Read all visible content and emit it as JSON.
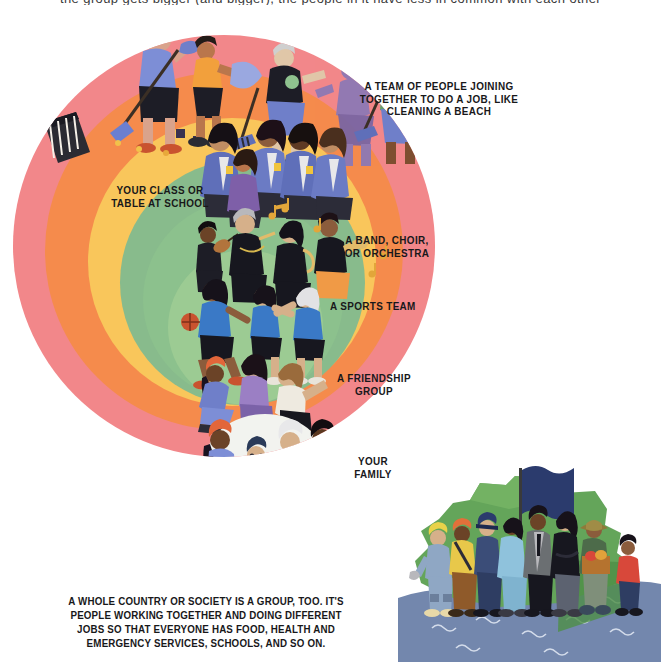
{
  "page": {
    "background": "#ffffff",
    "top_cut_text": "the group gets bigger (and bigger), the people in it have less in common with each other"
  },
  "circles": [
    {
      "name": "country",
      "label": "A TEAM OF PEOPLE JOINING TOGETHER TO DO A JOB, LIKE CLEANING A BEACH",
      "color": "#f2878a"
    },
    {
      "name": "team",
      "label": "YOUR CLASS OR TABLE AT SCHOOL",
      "color": "#f58b4c"
    },
    {
      "name": "class",
      "label": "A BAND, CHOIR, OR ORCHESTRA",
      "color": "#f9c65b"
    },
    {
      "name": "band",
      "label": "A SPORTS TEAM",
      "color": "#88bb8c"
    },
    {
      "name": "sports",
      "label": "A FRIENDSHIP GROUP",
      "color": "#8cc18d"
    },
    {
      "name": "friendship",
      "label": "YOUR FAMILY",
      "color": "#9ccb93"
    },
    {
      "name": "family",
      "label": "YOUR FAMILY",
      "color": "#f2f3ef"
    }
  ],
  "labels": {
    "beach_team": "A TEAM OF PEOPLE JOINING\nTOGETHER TO DO A JOB, LIKE\nCLEANING A BEACH",
    "beach_team_l1": "A TEAM OF PEOPLE JOINING",
    "beach_team_l2": "TOGETHER TO DO A JOB, LIKE",
    "beach_team_l3": "CLEANING A BEACH",
    "school_l1": "YOUR CLASS OR",
    "school_l2": "TABLE AT SCHOOL",
    "music_l1": "A BAND, CHOIR,",
    "music_l2": "OR ORCHESTRA",
    "sports": "A SPORTS TEAM",
    "friendship_l1": "A FRIENDSHIP",
    "friendship_l2": "GROUP",
    "family_l1": "YOUR",
    "family_l2": "FAMILY"
  },
  "caption": {
    "line1": "A WHOLE COUNTRY OR SOCIETY IS A GROUP, TOO. IT'S",
    "line2": "PEOPLE WORKING TOGETHER AND DOING DIFFERENT",
    "line3": "JOBS SO THAT EVERYONE HAS FOOD, HEALTH AND",
    "line4": "EMERGENCY SERVICES, SCHOOLS, AND SO ON."
  },
  "illustrations": {
    "beach_cleanup": "people-cleaning-beach-illustration",
    "school_class": "school-children-in-uniform-illustration",
    "band": "musicians-with-instruments-illustration",
    "sports_team": "basketball-players-illustration",
    "friends": "friends-sitting-on-grass-illustration",
    "family": "family-group-illustration",
    "country_island": "island-with-flag-and-workers-illustration"
  },
  "palette": {
    "pink": "#f2878a",
    "orange": "#f58b4c",
    "yellow": "#f9c65b",
    "green_outer": "#88bb8c",
    "green_mid": "#8cc18d",
    "green_inner": "#9ccb93",
    "family_white": "#f2f3ef",
    "island_green": "#6aa85a",
    "island_green_dark": "#4f8f45",
    "water_blue": "#6d84ad",
    "flag_navy": "#2b3a6b",
    "ink": "#18181a"
  }
}
